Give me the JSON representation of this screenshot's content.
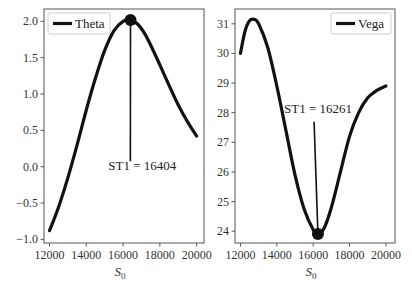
{
  "chart_data": [
    {
      "type": "line",
      "title": "",
      "xlabel": "S0",
      "xlabel_main": "S",
      "xlabel_sub": "0",
      "ylabel": "",
      "xlim": [
        11700,
        20400
      ],
      "ylim": [
        -1.05,
        2.17
      ],
      "grid": false,
      "legend_position": "upper left",
      "x_ticks": [
        12000,
        14000,
        16000,
        18000,
        20000
      ],
      "x_tick_labels": [
        "12000",
        "14000",
        "16000",
        "18000",
        "20000"
      ],
      "y_ticks": [
        2.0,
        1.5,
        1.0,
        0.5,
        0.0,
        -0.5,
        -1.0
      ],
      "y_tick_labels": [
        "2.0",
        "1.5",
        "1.0",
        "0.5",
        "0.0",
        "−0.5",
        "−1.0"
      ],
      "series": [
        {
          "name": "Theta",
          "color": "#111111",
          "x": [
            12000,
            12500,
            13000,
            13500,
            14000,
            14500,
            15000,
            15500,
            16000,
            16404,
            16800,
            17200,
            17600,
            18000,
            18500,
            19000,
            19500,
            20000
          ],
          "values": [
            -0.88,
            -0.55,
            -0.15,
            0.3,
            0.78,
            1.22,
            1.6,
            1.87,
            2.0,
            2.02,
            1.96,
            1.82,
            1.62,
            1.4,
            1.12,
            0.85,
            0.62,
            0.42
          ]
        }
      ],
      "marker": {
        "x": 16404,
        "y": 2.02
      },
      "annotation": {
        "text": "ST1 = 16404",
        "x": 16404,
        "y": 2.02,
        "text_x": 15200,
        "text_y": -0.05
      }
    },
    {
      "type": "line",
      "title": "",
      "xlabel": "S0",
      "xlabel_main": "S",
      "xlabel_sub": "0",
      "ylabel": "",
      "xlim": [
        11700,
        20500
      ],
      "ylim": [
        23.6,
        31.5
      ],
      "grid": false,
      "legend_position": "upper right",
      "x_ticks": [
        12000,
        14000,
        16000,
        18000,
        20000
      ],
      "x_tick_labels": [
        "12000",
        "14000",
        "16000",
        "18000",
        "20000"
      ],
      "y_ticks": [
        31,
        30,
        29,
        28,
        27,
        26,
        25,
        24
      ],
      "y_tick_labels": [
        "31",
        "30",
        "29",
        "28",
        "27",
        "26",
        "25",
        "24"
      ],
      "series": [
        {
          "name": "Vega",
          "color": "#111111",
          "x": [
            12000,
            12250,
            12500,
            12750,
            13000,
            13500,
            14000,
            14500,
            15000,
            15500,
            16000,
            16261,
            16600,
            17000,
            17500,
            18000,
            18500,
            19000,
            19500,
            20000
          ],
          "values": [
            30.0,
            30.75,
            31.1,
            31.15,
            31.0,
            30.2,
            28.9,
            27.4,
            25.9,
            24.75,
            24.05,
            23.9,
            24.1,
            24.8,
            26.0,
            27.2,
            28.0,
            28.5,
            28.75,
            28.9
          ]
        }
      ],
      "marker": {
        "x": 16261,
        "y": 23.9
      },
      "annotation": {
        "text": "ST1 = 16261",
        "x": 16261,
        "y": 23.9,
        "text_x": 14400,
        "text_y": 28.0
      }
    }
  ]
}
